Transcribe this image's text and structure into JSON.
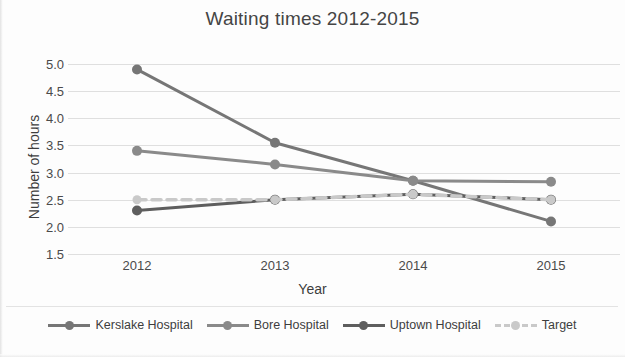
{
  "chart_data": {
    "type": "line",
    "title": "Waiting times 2012-2015",
    "xlabel": "Year",
    "ylabel": "Number of hours",
    "categories": [
      "2012",
      "2013",
      "2014",
      "2015"
    ],
    "ylim": [
      1.5,
      5.0
    ],
    "ytick_labels": [
      "5.0",
      "4.5",
      "4.0",
      "3.5",
      "3.0",
      "2.5",
      "2.0",
      "1.5"
    ],
    "ytick_values": [
      5.0,
      4.5,
      4.0,
      3.5,
      3.0,
      2.5,
      2.0,
      1.5
    ],
    "grid": true,
    "legend_position": "bottom",
    "series": [
      {
        "name": "Kerslake Hospital",
        "values": [
          4.9,
          3.55,
          2.85,
          2.1
        ],
        "color": "#767676",
        "style": "solid",
        "marker": "circle"
      },
      {
        "name": "Bore Hospital",
        "values": [
          3.4,
          3.15,
          2.85,
          2.83
        ],
        "color": "#8a8a8a",
        "style": "solid",
        "marker": "circle"
      },
      {
        "name": "Uptown Hospital",
        "values": [
          2.3,
          2.5,
          2.6,
          2.5
        ],
        "color": "#5e5e5e",
        "style": "solid",
        "marker": "circle"
      },
      {
        "name": "Target",
        "values": [
          2.5,
          2.5,
          2.6,
          2.5
        ],
        "color": "#c9c9c9",
        "style": "dashed",
        "marker": "circle"
      }
    ]
  },
  "colors": {
    "background": "#fdfdfd",
    "gridline": "#dfdfdf",
    "text": "#3d3d3d"
  }
}
